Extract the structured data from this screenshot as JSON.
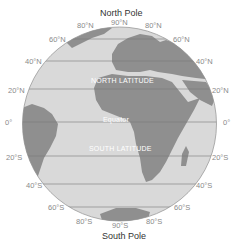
{
  "diagram": {
    "type": "globe-latitude",
    "top_label": "North Pole",
    "bottom_label": "South Pole",
    "region_labels": {
      "north": "NORTH LATITUDE",
      "equator": "Equator",
      "south": "SOUTH LATITUDE"
    },
    "latitudes": {
      "n90": "90°N",
      "n80_left": "80°N",
      "n80_right": "80°N",
      "n60_left": "60°N",
      "n60_right": "60°N",
      "n40_left": "40°N",
      "n40_right": "40°N",
      "n20_left": "20°N",
      "n20_right": "20°N",
      "eq_left": "0°",
      "eq_right": "0°",
      "s20_left": "20°S",
      "s20_right": "20°S",
      "s40_left": "40°S",
      "s40_right": "40°S",
      "s60_left": "60°S",
      "s60_right": "60°S",
      "s80_left": "80°S",
      "s80_right": "80°S",
      "s90": "90°S"
    },
    "colors": {
      "ocean": "#d9d9d9",
      "land": "#8f8f8f",
      "lines": "#7a7a7a",
      "labels": "#8a8a8a"
    }
  }
}
